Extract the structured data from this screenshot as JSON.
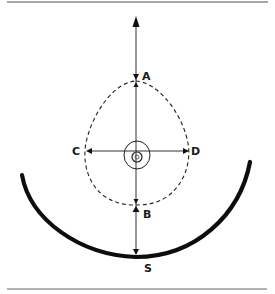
{
  "figure": {
    "colors": {
      "ink": "#111111",
      "rule": "#8a8a8a",
      "background": "#ffffff"
    },
    "labels": {
      "top_point": "A",
      "bottom_point": "B",
      "left_point": "C",
      "right_point": "D",
      "surface_point": "S"
    },
    "elements": {
      "vertical_axis": "Vertical line with arrows from top through A, center, B, to S",
      "horizontal_axis": "Double-headed horizontal line from C to D",
      "dashed_path": "Dashed teardrop-shaped curve through A, C, B, D",
      "center_marker": "Concentric circles at center",
      "bowl": "Thick curved surface with lowest point S"
    }
  }
}
